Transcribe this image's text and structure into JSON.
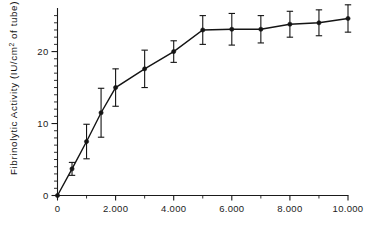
{
  "chart_data": {
    "type": "line",
    "title": "",
    "subtitle": "",
    "xlabel": "",
    "ylabel": "Fibrinolytic Activity (IU/cm² of tube)",
    "ylabel_parts": {
      "prefix": "Fibrinolytic  Activity  (IU/cm",
      "superscript": "2",
      "suffix": " of  tube)"
    },
    "xlim": [
      0,
      10000
    ],
    "ylim": [
      0,
      25.5
    ],
    "grid": false,
    "legend": null,
    "x_ticks_major": [
      0,
      2000,
      4000,
      6000,
      8000,
      10000
    ],
    "x_tick_labels": [
      "0",
      "2.000",
      "4.000",
      "6.000",
      "8.000",
      "10.000"
    ],
    "x_ticks_minor": [
      1000,
      3000,
      5000,
      7000,
      9000
    ],
    "y_ticks_major": [
      0,
      10,
      20
    ],
    "y_tick_labels": [
      "0",
      "10",
      "20"
    ],
    "y_ticks_minor": [
      1,
      2,
      3,
      4,
      5,
      6,
      7,
      8,
      9,
      11,
      12,
      13,
      14,
      15,
      16,
      17,
      18,
      19,
      21,
      22,
      23,
      24,
      25
    ],
    "series": [
      {
        "name": "Fibrinolytic activity",
        "marker": "filled-circle",
        "color": "#141414",
        "x": [
          0,
          500,
          1000,
          1500,
          2000,
          3000,
          4000,
          5000,
          6000,
          7000,
          8000,
          9000,
          10000
        ],
        "values": [
          0.0,
          3.7,
          7.5,
          11.5,
          15.0,
          17.6,
          20.0,
          23.0,
          23.1,
          23.1,
          23.8,
          24.0,
          24.6
        ],
        "error": [
          0.0,
          0.9,
          2.4,
          3.4,
          2.6,
          2.6,
          1.5,
          2.0,
          2.2,
          1.9,
          1.8,
          1.8,
          1.9
        ]
      }
    ]
  },
  "colors": {
    "ink": "#141414",
    "axis": "#1a1a1a",
    "background": "#ffffff"
  }
}
